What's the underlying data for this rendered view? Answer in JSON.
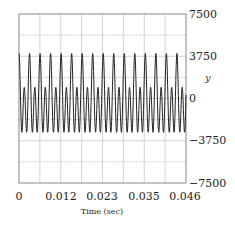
{
  "chart_data": {
    "type": "line",
    "title": "",
    "xlabel": "Time (sec)",
    "ylabel": "y",
    "xlim": [
      0,
      0.046
    ],
    "ylim": [
      -7500,
      7500
    ],
    "x_ticks": [
      "0",
      "0.012",
      "0.023",
      "0.035",
      "0.046"
    ],
    "y_ticks": [
      "7500",
      "3750",
      "0",
      "−3750",
      "−7500"
    ],
    "grid": true,
    "y_axis_position": "right",
    "series": [
      {
        "name": "y",
        "description": "Periodic signal, ~16 cycles over 0.046 s (period ~0.0029 s); main peaks ~+4000, secondary peaks ~+1000, troughs ~-3000",
        "period_sec": 0.0029,
        "main_peak": 4000,
        "secondary_peak": 1000,
        "trough": -3000,
        "harmonics": [
          {
            "order": 1,
            "amplitude": 1500
          },
          {
            "order": 2,
            "amplitude": 2700
          }
        ],
        "offset": -200
      }
    ]
  },
  "colors": {
    "line": "#222222",
    "grid": "#c8c8c8",
    "frame": "#888888"
  }
}
